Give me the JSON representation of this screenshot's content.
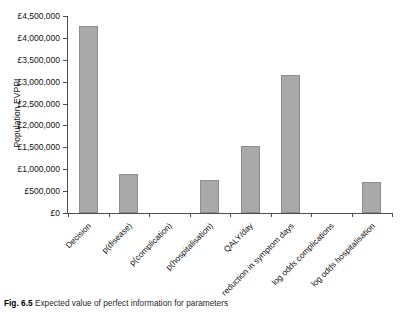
{
  "figure": {
    "caption_number": "Fig. 6.5",
    "caption_text": "Expected value of perfect information for parameters"
  },
  "chart_data": {
    "type": "bar",
    "title": "",
    "xlabel": "",
    "ylabel": "Population EVPPI",
    "categories": [
      "Decision",
      "p(disease)",
      "p(complication)",
      "p(hospitalisation)",
      "QALY/day",
      "reduction in symptom days",
      "log odds complications",
      "log odds hospitalisation"
    ],
    "values": [
      4270000,
      890000,
      0,
      760000,
      1530000,
      3150000,
      0,
      710000
    ],
    "ylim": [
      0,
      4500000
    ],
    "ytick_values": [
      0,
      500000,
      1000000,
      1500000,
      2000000,
      2500000,
      3000000,
      3500000,
      4000000,
      4500000
    ],
    "ytick_labels": [
      "£0",
      "£500,000",
      "£1,000,000",
      "£1,500,000",
      "£2,000,000",
      "£2,500,000",
      "£3,000,000",
      "£3,500,000",
      "£4,000,000",
      "£4,500,000"
    ],
    "grid": false,
    "legend": null,
    "bar_color": "#a9a9a9",
    "bar_border_color": "#8e8e8e",
    "axis_color": "#4d4d4d"
  }
}
